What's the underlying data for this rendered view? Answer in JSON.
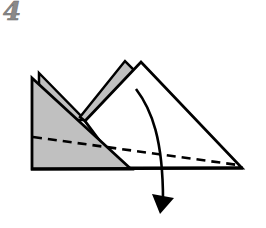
{
  "step": {
    "number": "4"
  },
  "diagram": {
    "colors": {
      "paper_back": "#c0c0c0",
      "paper_front": "#ffffff",
      "outline": "#000000",
      "step_number": "#8a8a8a"
    },
    "elements": [
      {
        "name": "back-gray-layer",
        "description": "gray back layer peeking behind front triangle"
      },
      {
        "name": "gray-strip",
        "description": "gray layer edge behind white triangle"
      },
      {
        "name": "white-triangle",
        "description": "front white triangle flap"
      },
      {
        "name": "gray-triangle",
        "description": "front-left gray triangle"
      },
      {
        "name": "valley-fold-line",
        "description": "dashed fold line"
      },
      {
        "name": "fold-arrow",
        "description": "curved arrow indicating fold downward"
      }
    ]
  }
}
